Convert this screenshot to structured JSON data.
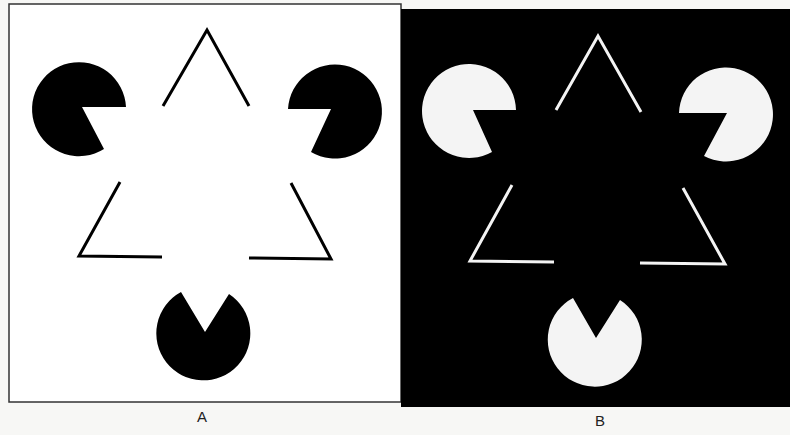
{
  "figure": {
    "panels": [
      {
        "id": "A",
        "label": "A",
        "background": "#ffffff",
        "foreground": "#000000",
        "frame": {
          "x": 9,
          "y": 4,
          "w": 392,
          "h": 398
        },
        "label_pos": {
          "x": 202,
          "y": 410
        }
      },
      {
        "id": "B",
        "label": "B",
        "background": "#000000",
        "foreground": "#f4f4f4",
        "frame": {
          "x": 401,
          "y": 9,
          "w": 389,
          "h": 398
        },
        "label_pos": {
          "x": 600,
          "y": 414
        }
      }
    ]
  }
}
